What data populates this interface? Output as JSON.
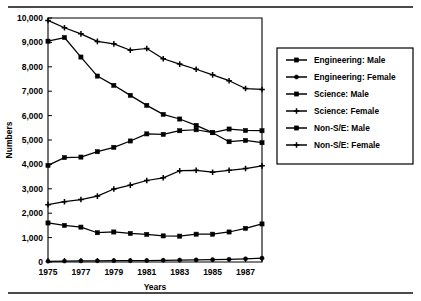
{
  "figure": {
    "top_rule": "horizontal-rule",
    "bottom_rule": "horizontal-rule"
  },
  "chart_data": {
    "type": "line",
    "title": "",
    "xlabel": "Years",
    "ylabel": "Numbers",
    "xlim": [
      1975,
      1988
    ],
    "ylim": [
      0,
      10000
    ],
    "ytick_labels": [
      "0",
      "1,000",
      "2,000",
      "3,000",
      "4,000",
      "5,000",
      "6,000",
      "7,000",
      "8,000",
      "9,000",
      "10,000"
    ],
    "ytick_values": [
      0,
      1000,
      2000,
      3000,
      4000,
      5000,
      6000,
      7000,
      8000,
      9000,
      10000
    ],
    "xtick_labels": [
      "1975",
      "1977",
      "1979",
      "1981",
      "1983",
      "1985",
      "1987"
    ],
    "xtick_values": [
      1975,
      1977,
      1979,
      1981,
      1983,
      1985,
      1987
    ],
    "x": [
      1975,
      1976,
      1977,
      1978,
      1979,
      1980,
      1981,
      1982,
      1983,
      1984,
      1985,
      1986,
      1987,
      1988
    ],
    "grid": false,
    "legend_position": "right",
    "series": [
      {
        "name": "Engineering: Male",
        "marker": "square",
        "values": [
          1600,
          1500,
          1430,
          1200,
          1230,
          1170,
          1130,
          1070,
          1060,
          1140,
          1140,
          1230,
          1380,
          1560
        ]
      },
      {
        "name": "Engineering: Female",
        "marker": "circle",
        "values": [
          30,
          40,
          45,
          50,
          55,
          55,
          60,
          70,
          80,
          85,
          95,
          110,
          130,
          155
        ]
      },
      {
        "name": "Science: Male",
        "marker": "square",
        "values": [
          3960,
          4280,
          4300,
          4520,
          4700,
          4960,
          5250,
          5230,
          5380,
          5420,
          5300,
          5450,
          5390,
          5380
        ]
      },
      {
        "name": "Science: Female",
        "marker": "plus",
        "values": [
          2350,
          2470,
          2560,
          2700,
          2990,
          3150,
          3340,
          3450,
          3740,
          3760,
          3680,
          3760,
          3830,
          3940
        ]
      },
      {
        "name": "Non-S/E: Male",
        "marker": "square",
        "values": [
          9050,
          9200,
          8400,
          7620,
          7240,
          6830,
          6420,
          6050,
          5860,
          5600,
          5300,
          4930,
          4980,
          4890
        ]
      },
      {
        "name": "Non-S/E: Female",
        "marker": "plus",
        "values": [
          9900,
          9600,
          9350,
          9040,
          8940,
          8680,
          8750,
          8330,
          8110,
          7900,
          7670,
          7430,
          7110,
          7070
        ]
      }
    ]
  },
  "legend": {
    "entries": [
      {
        "label": "Engineering: Male"
      },
      {
        "label": "Engineering: Female"
      },
      {
        "label": "Science: Male"
      },
      {
        "label": "Science: Female"
      },
      {
        "label": "Non-S/E: Male"
      },
      {
        "label": "Non-S/E: Female"
      }
    ]
  }
}
